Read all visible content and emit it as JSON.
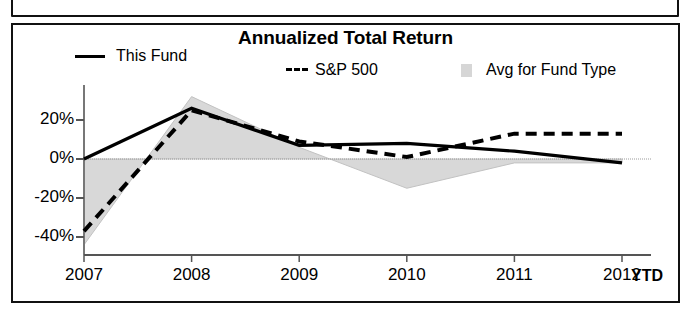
{
  "panel": {
    "title": "Annualized Total Return"
  },
  "legend": {
    "position": "top",
    "entries": [
      {
        "label": "This Fund",
        "marker": "solid-line",
        "color": "#000000"
      },
      {
        "label": "S&P 500",
        "marker": "dashed-line",
        "color": "#000000"
      },
      {
        "label": "Avg for Fund Type",
        "marker": "area-swatch",
        "color": "#d6d6d6"
      }
    ]
  },
  "axis": {
    "x_suffix": "YTD"
  },
  "chart_data": {
    "type": "line",
    "title": "Annualized Total Return",
    "xlabel": "",
    "ylabel": "",
    "categories": [
      "2007",
      "2008",
      "2009",
      "2010",
      "2011",
      "2012"
    ],
    "x_tick_labels": [
      "2007",
      "2008",
      "2009",
      "2010",
      "2011",
      "2012"
    ],
    "x_axis_note": "YTD",
    "y_tick_labels": [
      "20%",
      "0%",
      "-20%",
      "-40%"
    ],
    "y_ticks": [
      20,
      0,
      -20,
      -40
    ],
    "ylim": [
      -48,
      36
    ],
    "grid": false,
    "zero_line": true,
    "series": [
      {
        "name": "This Fund",
        "style": "solid",
        "color": "#000000",
        "values": [
          0,
          26,
          7,
          8,
          4,
          -2
        ]
      },
      {
        "name": "S&P 500",
        "style": "dashed",
        "color": "#000000",
        "values": [
          -37,
          25,
          9,
          1,
          13,
          13
        ]
      },
      {
        "name": "Avg for Fund Type",
        "style": "area",
        "color": "#d6d6d6",
        "values": [
          -44,
          32,
          6,
          -15,
          -2,
          -2
        ]
      }
    ]
  }
}
